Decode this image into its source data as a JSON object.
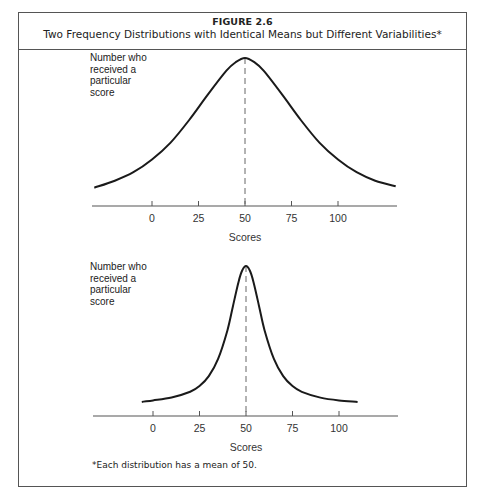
{
  "figure": {
    "number": "FIGURE 2.6",
    "title": "Two Frequency Distributions with Identical Means but Different Variabilities*",
    "footnote": "*Each distribution has a mean of 50."
  },
  "colors": {
    "curve": "#1a1a1a",
    "axis": "#555555",
    "border": "#555555",
    "mean_line": "#666666"
  },
  "chart_data": [
    {
      "type": "line",
      "title": "Wide-variability distribution",
      "ylabel": "Number who received a particular score",
      "xlabel": "Scores",
      "tick_labels": [
        "0",
        "25",
        "50",
        "75",
        "100"
      ],
      "ticks": [
        0,
        25,
        50,
        75,
        100
      ],
      "mean": 50,
      "xlim": [
        -32,
        132
      ],
      "ylim": [
        0,
        1
      ],
      "grid": false,
      "legend": "none",
      "series": [
        {
          "name": "broad distribution",
          "x": [
            -31,
            -20,
            -10,
            0,
            10,
            20,
            30,
            40,
            45,
            50,
            55,
            60,
            70,
            80,
            90,
            100,
            110,
            120,
            131
          ],
          "y": [
            0.08,
            0.13,
            0.19,
            0.28,
            0.4,
            0.56,
            0.74,
            0.91,
            0.97,
            1.0,
            0.97,
            0.91,
            0.74,
            0.56,
            0.4,
            0.28,
            0.19,
            0.13,
            0.09
          ]
        }
      ]
    },
    {
      "type": "line",
      "title": "Narrow-variability distribution",
      "ylabel": "Number who received a particular score",
      "xlabel": "Scores",
      "tick_labels": [
        "0",
        "25",
        "50",
        "75",
        "100"
      ],
      "ticks": [
        0,
        25,
        50,
        75,
        100
      ],
      "mean": 50,
      "xlim": [
        -6,
        110
      ],
      "ylim": [
        0,
        1
      ],
      "grid": false,
      "legend": "none",
      "series": [
        {
          "name": "narrow distribution",
          "x": [
            -6,
            0,
            10,
            20,
            25,
            30,
            35,
            40,
            43,
            46,
            48,
            50,
            52,
            54,
            57,
            60,
            65,
            70,
            75,
            80,
            90,
            100,
            110
          ],
          "y": [
            0.05,
            0.06,
            0.08,
            0.12,
            0.16,
            0.23,
            0.35,
            0.55,
            0.72,
            0.89,
            0.97,
            1.0,
            0.97,
            0.89,
            0.72,
            0.55,
            0.35,
            0.23,
            0.16,
            0.12,
            0.08,
            0.06,
            0.05
          ]
        }
      ]
    }
  ],
  "layout": {
    "panels": [
      {
        "baseline_y": 206,
        "peak_y": 58,
        "x0_px": 152,
        "px_per_unit": 1.86,
        "axis_x1": 92,
        "axis_x2": 397,
        "label_x": 90,
        "label_y": 57,
        "xlabel_y": 243
      },
      {
        "baseline_y": 416,
        "peak_y": 266,
        "x0_px": 153,
        "px_per_unit": 1.86,
        "axis_x1": 93,
        "axis_x2": 398,
        "label_x": 90,
        "label_y": 264,
        "xlabel_y": 453
      }
    ]
  },
  "labels": {
    "ylabel_lines": [
      "Number who",
      "received a",
      "particular",
      "score"
    ]
  }
}
